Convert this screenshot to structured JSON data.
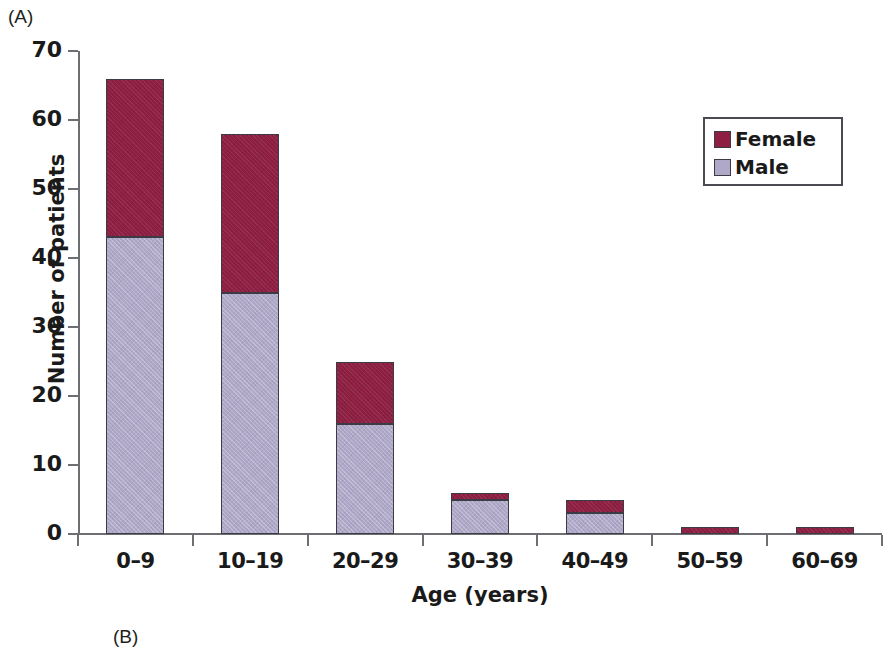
{
  "panels": {
    "a_label": "(A)",
    "b_label": "(B)"
  },
  "legend": {
    "position": "top-right",
    "items": [
      {
        "label": "Female",
        "color": "#8e1f43"
      },
      {
        "label": "Male",
        "color": "#afa8c8"
      }
    ]
  },
  "chart_data": {
    "type": "bar",
    "subtype": "stacked-vertical",
    "title": "",
    "xlabel": "Age (years)",
    "ylabel": "Number of patients",
    "categories": [
      "0–9",
      "10–19",
      "20–29",
      "30–39",
      "40–49",
      "50–59",
      "60–69"
    ],
    "series": [
      {
        "name": "Male",
        "color": "#afa8c8",
        "values": [
          43,
          35,
          16,
          5,
          3,
          0,
          0
        ]
      },
      {
        "name": "Female",
        "color": "#8e1f43",
        "values": [
          23,
          23,
          9,
          1,
          2,
          1,
          1
        ]
      }
    ],
    "totals": [
      66,
      58,
      25,
      6,
      5,
      1,
      1
    ],
    "ylim": [
      0,
      70
    ],
    "yticks": [
      0,
      10,
      20,
      30,
      40,
      50,
      60,
      70
    ],
    "ytick_labels": [
      "0",
      "10",
      "20",
      "30",
      "40",
      "50",
      "60",
      "70"
    ],
    "grid": false,
    "legend_position": "upper right"
  }
}
